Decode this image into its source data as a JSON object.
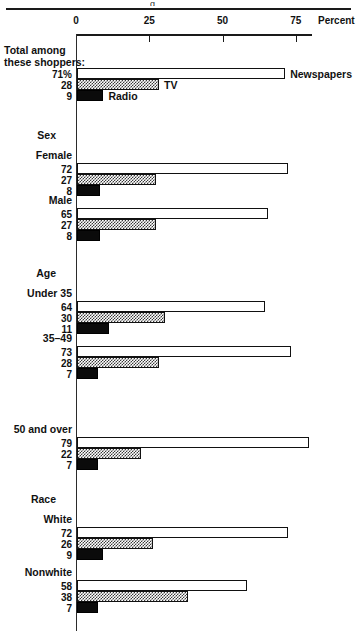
{
  "figure": {
    "top_rule_fragment": "g",
    "axis": {
      "title": "Percent",
      "ticks": [
        0,
        25,
        50,
        75
      ],
      "tick_labels": [
        "0",
        "25",
        "50",
        "75"
      ],
      "min": 0,
      "max": 75,
      "axis_end_value": 80.5
    },
    "series_labels": {
      "newspapers": "Newspapers",
      "tv": "TV",
      "radio": "Radio"
    }
  },
  "chart_data": {
    "type": "bar",
    "title": "",
    "xlabel": "Percent",
    "ylabel": "",
    "xlim": [
      0,
      80.5
    ],
    "grid": false,
    "orientation": "horizontal",
    "legend": [
      "Newspapers",
      "TV",
      "Radio"
    ],
    "groups": [
      {
        "header": "",
        "category": "Total among these shoppers:",
        "category_lines": [
          "Total among",
          "these shoppers:"
        ],
        "is_total": true,
        "values": [
          71,
          28,
          9
        ],
        "value_labels": [
          "71%",
          "28",
          "9"
        ]
      },
      {
        "header": "Sex",
        "category": "Female",
        "values": [
          72,
          27,
          8
        ],
        "value_labels": [
          "72",
          "27",
          "8"
        ]
      },
      {
        "header": "",
        "category": "Male",
        "values": [
          65,
          27,
          8
        ],
        "value_labels": [
          "65",
          "27",
          "8"
        ]
      },
      {
        "header": "Age",
        "category": "Under 35",
        "values": [
          64,
          30,
          11
        ],
        "value_labels": [
          "64",
          "30",
          "11"
        ]
      },
      {
        "header": "",
        "category": "35–49",
        "values": [
          73,
          28,
          7
        ],
        "value_labels": [
          "73",
          "28",
          "7"
        ]
      },
      {
        "header": "",
        "category": "50 and over",
        "values": [
          79,
          22,
          7
        ],
        "value_labels": [
          "79",
          "22",
          "7"
        ]
      },
      {
        "header": "Race",
        "category": "White",
        "values": [
          72,
          26,
          9
        ],
        "value_labels": [
          "72",
          "26",
          "9"
        ]
      },
      {
        "header": "",
        "category": "Nonwhite",
        "values": [
          58,
          38,
          7
        ],
        "value_labels": [
          "58",
          "38",
          "7"
        ]
      }
    ],
    "series": [
      {
        "name": "Newspapers",
        "values": [
          71,
          72,
          65,
          64,
          73,
          79,
          72,
          58
        ]
      },
      {
        "name": "TV",
        "values": [
          28,
          27,
          27,
          30,
          28,
          22,
          26,
          38
        ]
      },
      {
        "name": "Radio",
        "values": [
          9,
          8,
          8,
          11,
          7,
          7,
          9,
          7
        ]
      }
    ],
    "categories": [
      "Total among these shoppers:",
      "Female",
      "Male",
      "Under 35",
      "35–49",
      "50 and over",
      "White",
      "Nonwhite"
    ]
  }
}
